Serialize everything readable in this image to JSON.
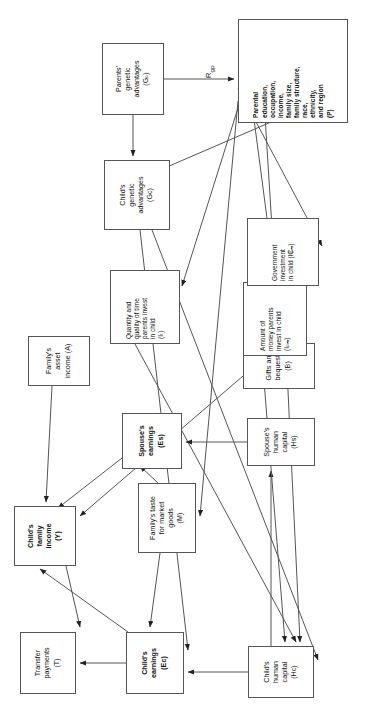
{
  "figure": {
    "type": "flow-diagram",
    "orientation": "rotated-90-ccw",
    "background": "#ffffff",
    "line_color": "#555555",
    "text_color": "#111111"
  },
  "nodes": [
    {
      "id": "T",
      "label": "Transfer\npayments\n(T)",
      "bold": false,
      "x": 22,
      "y": 20,
      "w": 62,
      "h": 56
    },
    {
      "id": "Ec",
      "label": "Child's\nearnings\n(Ec)",
      "bold": true,
      "x": 22,
      "y": 126,
      "w": 62,
      "h": 58
    },
    {
      "id": "Hc",
      "label": "Child's\nhuman\ncapital\n(Hc)",
      "bold": false,
      "x": 18,
      "y": 248,
      "w": 52,
      "h": 66
    },
    {
      "id": "Y",
      "label": "Child's\nfamily\nincome\n(Y)",
      "bold": true,
      "x": 150,
      "y": 14,
      "w": 60,
      "h": 62
    },
    {
      "id": "M",
      "label": "Family's taste\nfor market\ngoods\n(M)",
      "bold": false,
      "x": 163,
      "y": 138,
      "w": 70,
      "h": 58
    },
    {
      "id": "Hs",
      "label": "Spouse's\nhuman\ncapital\n(Hs)",
      "bold": false,
      "x": 250,
      "y": 247,
      "w": 48,
      "h": 68
    },
    {
      "id": "Es",
      "label": "Spouse's\nearnings\n(Es)",
      "bold": true,
      "x": 247,
      "y": 122,
      "w": 56,
      "h": 60
    },
    {
      "id": "A",
      "label": "Family's\nasset\nincome (A)",
      "bold": false,
      "x": 330,
      "y": 28,
      "w": 50,
      "h": 62
    },
    {
      "id": "B",
      "label": "Gifts and\nbequests (B)",
      "bold": false,
      "x": 327,
      "y": 243,
      "w": 46,
      "h": 72
    },
    {
      "id": "It",
      "label": "Quantity and\nquality of time\nparents invest\nin child\n(Iₜ)",
      "bold": false,
      "x": 372,
      "y": 110,
      "w": 74,
      "h": 70
    },
    {
      "id": "Ipm",
      "label": "Amount of\nmoney parents\ninvest in child\n(Iₚₘ)",
      "bold": false,
      "x": 360,
      "y": 243,
      "w": 74,
      "h": 64
    },
    {
      "id": "Igm",
      "label": "Government\ninvestment\nin child (I₵ₘ)",
      "bold": false,
      "x": 430,
      "y": 247,
      "w": 68,
      "h": 72
    },
    {
      "id": "Gc",
      "label": "Child's\ngenetic\nadvantages\n(Gc)",
      "bold": false,
      "x": 486,
      "y": 104,
      "w": 70,
      "h": 66
    },
    {
      "id": "Gp",
      "label": "Parents'\ngenetic\nadvantages\n(Gₚ)",
      "bold": false,
      "x": 601,
      "y": 102,
      "w": 72,
      "h": 62
    },
    {
      "id": "P",
      "label": "Parental\neducation,\noccupation,\nincome,\nfamily size,\nfamily structure,\nrace,\nethnicity,\nand region\n(P)",
      "bold": true,
      "x": 593,
      "y": 238,
      "w": 104,
      "h": 110
    }
  ],
  "edge_labels": [
    {
      "id": "Rgp",
      "text": "R",
      "sub": "gp",
      "x": 638,
      "y": 204
    }
  ],
  "node_labels": {
    "T": "Transfer payments (T)",
    "Ec": "Child's earnings (Ec)",
    "Hc": "Child's human capital (Hc)",
    "Y": "Child's family income (Y)",
    "M": "Family's taste for market goods (M)",
    "Hs": "Spouse's human capital (Hs)",
    "Es": "Spouse's earnings (Es)",
    "A": "Family's asset income (A)",
    "B": "Gifts and bequests (B)",
    "It": "Quantity and quality of time parents invest in child (It)",
    "Ipm": "Amount of money parents invest in child (Ipm)",
    "Igm": "Government investment in child (Igm)",
    "Gc": "Child's genetic advantages (Gc)",
    "Gp": "Parents' genetic advantages (Gp)",
    "P": "Parental education, occupation, income, family size, family structure, race, ethnicity, and region (P)"
  }
}
